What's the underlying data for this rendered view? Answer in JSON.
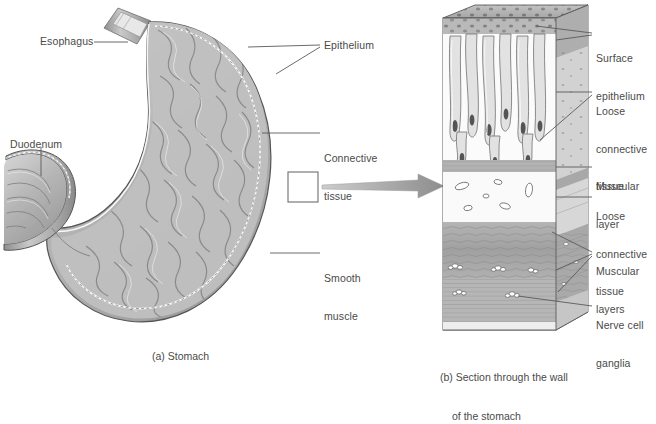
{
  "figure": {
    "background_color": "#ffffff",
    "text_color": "#4a4a4a",
    "leader_color": "#5a5a5a",
    "arrow_color": "#9a9a9a"
  },
  "panel_a": {
    "caption": "(a) Stomach",
    "labels": [
      {
        "id": "esophagus",
        "text": "Esophagus"
      },
      {
        "id": "duodenum",
        "text": "Duodenum"
      },
      {
        "id": "epithelium",
        "text": "Epithelium"
      },
      {
        "id": "connective-tissue",
        "line1": "Connective",
        "line2": "tissue"
      },
      {
        "id": "smooth-muscle",
        "line1": "Smooth",
        "line2": "muscle"
      }
    ]
  },
  "panel_b": {
    "caption_line1": "(b) Section through the wall",
    "caption_line2": "of the stomach",
    "labels": [
      {
        "id": "surface-epithelium",
        "line1": "Surface",
        "line2": "epithelium"
      },
      {
        "id": "loose-connective-tissue-upper",
        "line1": "Loose",
        "line2": "connective",
        "line3": "tissue"
      },
      {
        "id": "muscular-layer",
        "line1": "Muscular",
        "line2": "layer"
      },
      {
        "id": "loose-connective-tissue-lower",
        "line1": "Loose",
        "line2": "connective",
        "line3": "tissue"
      },
      {
        "id": "muscular-layers",
        "line1": "Muscular",
        "line2": "layers"
      },
      {
        "id": "nerve-cell-ganglia",
        "line1": "Nerve cell",
        "line2": "ganglia"
      }
    ]
  },
  "connector": {
    "id": "magnification-arrow",
    "from": "detail-box",
    "to": "panel-b"
  }
}
